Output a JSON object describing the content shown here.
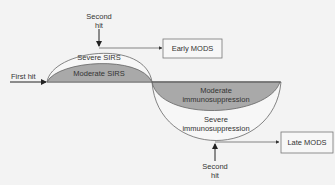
{
  "diagram": {
    "baseline_label": "First hit",
    "top": {
      "second_hit_line1": "Second",
      "second_hit_line2": "hit",
      "outer_region_label": "Severe SIRS",
      "inner_region_label": "Moderate SIRS",
      "outcome_box": "Early MODS"
    },
    "bottom": {
      "inner_region_line1": "Moderate",
      "inner_region_line2": "immunosuppression",
      "outer_region_line1": "Severe",
      "outer_region_line2": "immunosuppression",
      "second_hit_line1": "Second",
      "second_hit_line2": "hit",
      "outcome_box": "Late MODS"
    },
    "colors": {
      "background": "#f3f3f3",
      "shaded_region": "#a9a9a9",
      "outer_region": "#f7f7f7",
      "line": "#555555",
      "arrow": "#222222",
      "box_border": "#777777"
    }
  }
}
